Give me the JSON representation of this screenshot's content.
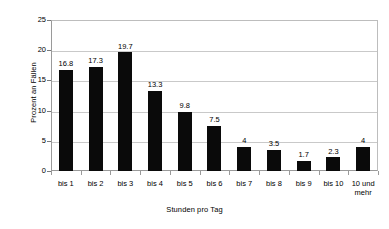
{
  "chart_data": {
    "type": "bar",
    "title": "",
    "subtitle": "",
    "xlabel": "Stunden pro Tag",
    "ylabel": "Prozent an Fällen",
    "categories": [
      "bis 1",
      "bis 2",
      "bis 3",
      "bis 4",
      "bis 5",
      "bis 6",
      "bis 7",
      "bis 8",
      "bis 9",
      "bis 10",
      "10 und\nmehr"
    ],
    "values": [
      16.8,
      17.3,
      19.7,
      13.3,
      9.8,
      7.5,
      4,
      3.5,
      1.7,
      2.3,
      4
    ],
    "value_labels": [
      "16.8",
      "17.3",
      "19.7",
      "13.3",
      "9.8",
      "7.5",
      "4",
      "3.5",
      "1.7",
      "2.3",
      "4"
    ],
    "ylim": [
      0,
      25
    ],
    "yticks": [
      0,
      5,
      10,
      15,
      20,
      25
    ],
    "ytick_labels": [
      "0",
      "5",
      "10",
      "15",
      "20",
      "25"
    ],
    "grid": true,
    "grid_axis": "y",
    "legend": false,
    "bar_color": "#0a0a0a",
    "grid_color": "#c9c9c9",
    "axis_color": "#9a9a9a",
    "background": "#ffffff"
  }
}
